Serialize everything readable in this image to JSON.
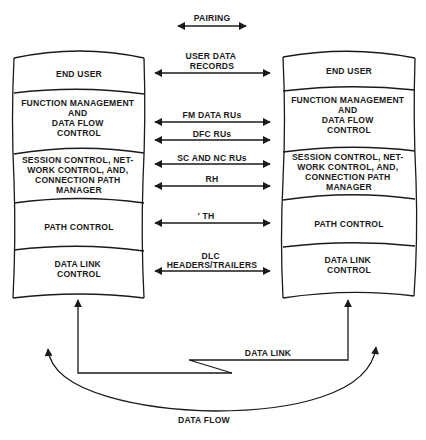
{
  "pairing_label": "PAIRING",
  "left_stack": {
    "layers": [
      {
        "lines": [
          "END USER"
        ]
      },
      {
        "lines": [
          "FUNCTION MANAGEMENT",
          "AND",
          "DATA FLOW",
          "CONTROL"
        ]
      },
      {
        "lines": [
          "SESSION CONTROL, NET-",
          "WORK CONTROL, AND,",
          "CONNECTION PATH",
          "MANAGER"
        ]
      },
      {
        "lines": [
          "PATH CONTROL"
        ]
      },
      {
        "lines": [
          "DATA LINK",
          "CONTROL"
        ]
      }
    ]
  },
  "right_stack": {
    "layers": [
      {
        "lines": [
          "END USER"
        ]
      },
      {
        "lines": [
          "FUNCTION MANAGEMENT",
          "AND",
          "DATA FLOW",
          "CONTROL"
        ]
      },
      {
        "lines": [
          "SESSION CONTROL, NET-",
          "WORK CONTROL, AND,",
          "CONNECTION PATH",
          "MANAGER"
        ]
      },
      {
        "lines": [
          "PATH CONTROL"
        ]
      },
      {
        "lines": [
          "DATA LINK",
          "CONTROL"
        ]
      }
    ]
  },
  "exchanges": [
    {
      "lines": [
        "USER DATA",
        "RECORDS"
      ]
    },
    {
      "lines": [
        "FM DATA RUs"
      ]
    },
    {
      "lines": [
        "DFC RUs"
      ]
    },
    {
      "lines": [
        "SC AND NC RUs"
      ]
    },
    {
      "lines": [
        "RH"
      ]
    },
    {
      "lines": [
        "' TH"
      ]
    },
    {
      "lines": [
        "DLC",
        "HEADERS/TRAILERS"
      ]
    }
  ],
  "data_link_label": "DATA LINK",
  "data_flow_label": "DATA FLOW"
}
